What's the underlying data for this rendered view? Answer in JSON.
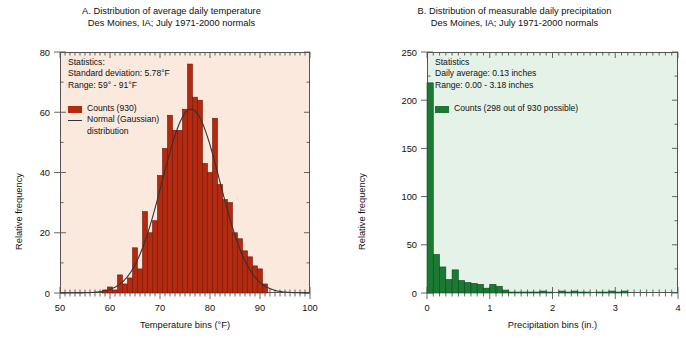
{
  "figure": {
    "panels": [
      "A",
      "B"
    ]
  },
  "panelA": {
    "title_line1": "A. Distribution of average daily temperature",
    "title_line2": "Des Moines, IA; July 1971-2000 normals",
    "stats_heading": "Statistics:",
    "stats_sd": "Standard deviation: 5.78°F",
    "stats_range": "Range: 59° - 91°F",
    "legend_counts": "Counts (930)",
    "legend_normal_line1": "Normal (Gaussian)",
    "legend_normal_line2": "distribution",
    "bar_color": "#b32a11",
    "bar_edge_color": "#6e1408",
    "bg_color": "#fbe9de",
    "curve_color": "#333333"
  },
  "panelB": {
    "title_line1": "B. Distribution of measurable daily precipitation",
    "title_line2": "Des Moines, IA; July 1971-2000 normals",
    "stats_heading": "Statistics",
    "stats_average": "Daily average: 0.13 inches",
    "stats_range": "Range: 0.00 - 3.18 inches",
    "legend_counts": "Counts (298 out of 930 possible)",
    "bar_color": "#1a7a33",
    "bar_edge_color": "#0d4a1d",
    "bg_color": "#e4f2e8"
  },
  "chart_data": [
    {
      "type": "bar",
      "id": "panel-a-temperature-histogram",
      "title": "A. Distribution of average daily temperature",
      "subtitle": "Des Moines, IA; July 1971-2000 normals",
      "xlabel": "Temperature bins (°F)",
      "ylabel": "Relative frequency",
      "xlim": [
        50,
        100
      ],
      "ylim": [
        0,
        80
      ],
      "xticks": [
        50,
        60,
        70,
        80,
        90,
        100
      ],
      "yticks": [
        0,
        20,
        40,
        60,
        80
      ],
      "minor_tick_interval": 1,
      "grid": false,
      "legend_position": "upper-left",
      "bin_width": 1,
      "x": [
        59,
        60,
        61,
        62,
        63,
        64,
        65,
        66,
        67,
        68,
        69,
        70,
        71,
        72,
        73,
        74,
        75,
        76,
        77,
        78,
        79,
        80,
        81,
        82,
        83,
        84,
        85,
        86,
        87,
        88,
        89,
        90,
        91
      ],
      "values": [
        1,
        2,
        1,
        6,
        3,
        5,
        15,
        8,
        27,
        20,
        24,
        39,
        48,
        59,
        54,
        54,
        61,
        76,
        65,
        64,
        43,
        40,
        58,
        36,
        31,
        30,
        20,
        18,
        14,
        12,
        9,
        8,
        3
      ],
      "series": [
        {
          "name": "Counts (930)",
          "type": "bar",
          "values": [
            1,
            2,
            1,
            6,
            3,
            5,
            15,
            8,
            27,
            20,
            24,
            39,
            48,
            59,
            54,
            54,
            61,
            76,
            65,
            64,
            43,
            40,
            58,
            36,
            31,
            30,
            20,
            18,
            14,
            12,
            9,
            8,
            3
          ]
        },
        {
          "name": "Normal (Gaussian) distribution",
          "type": "line",
          "mean": 76.2,
          "sd": 5.78,
          "peak": 61
        }
      ],
      "annotations": [
        "Statistics:",
        "Standard deviation: 5.78°F",
        "Range: 59° - 91°F"
      ]
    },
    {
      "type": "bar",
      "id": "panel-b-precipitation-histogram",
      "title": "B. Distribution of measurable daily precipitation",
      "subtitle": "Des Moines, IA; July 1971-2000 normals",
      "xlabel": "Precipitation bins (in.)",
      "ylabel": "Relative frequency",
      "xlim": [
        0,
        4
      ],
      "ylim": [
        0,
        250
      ],
      "xticks": [
        0,
        1,
        2,
        3,
        4
      ],
      "yticks": [
        0,
        50,
        100,
        150,
        200,
        250
      ],
      "minor_tick_interval": 0.1,
      "grid": false,
      "legend_position": "upper-left",
      "bin_width": 0.1,
      "x": [
        0.05,
        0.15,
        0.25,
        0.35,
        0.45,
        0.55,
        0.65,
        0.75,
        0.85,
        0.95,
        1.05,
        1.15,
        1.25,
        1.35,
        1.45,
        1.55,
        1.65,
        1.75,
        1.85,
        1.95,
        2.05,
        2.15,
        2.25,
        2.35,
        2.45,
        2.55,
        2.65,
        2.75,
        2.85,
        2.95,
        3.05,
        3.15,
        3.25,
        3.35,
        3.45,
        3.55,
        3.65,
        3.75,
        3.85,
        3.95
      ],
      "values": [
        218,
        40,
        27,
        14,
        24,
        13,
        11,
        10,
        9,
        5,
        9,
        7,
        3,
        1,
        1,
        1,
        1,
        1,
        2,
        1,
        0,
        2,
        1,
        2,
        1,
        1,
        0,
        1,
        1,
        2,
        1,
        2,
        0,
        0,
        0,
        0,
        0,
        0,
        0,
        0
      ],
      "series": [
        {
          "name": "Counts (298 out of 930 possible)",
          "type": "bar",
          "values": [
            218,
            40,
            27,
            14,
            24,
            13,
            11,
            10,
            9,
            5,
            9,
            7,
            3,
            1,
            1,
            1,
            1,
            1,
            2,
            1,
            0,
            2,
            1,
            2,
            1,
            1,
            0,
            1,
            1,
            2,
            1,
            2,
            0,
            0,
            0,
            0,
            0,
            0,
            0,
            0
          ]
        }
      ],
      "annotations": [
        "Statistics",
        "Daily average: 0.13 inches",
        "Range: 0.00 - 3.18 inches"
      ]
    }
  ]
}
